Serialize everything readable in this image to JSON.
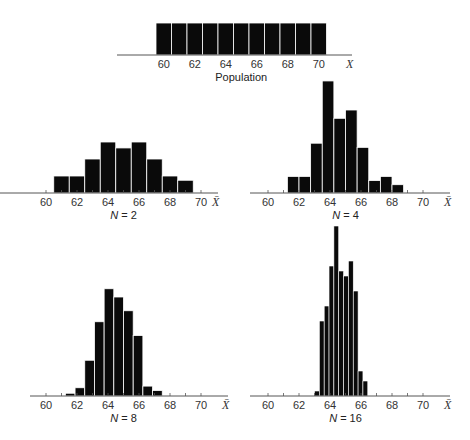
{
  "chart_data": [
    {
      "id": "population",
      "type": "bar",
      "title": "Population",
      "xlabel": "X",
      "x_ticks": [
        60,
        62,
        64,
        66,
        68,
        70
      ],
      "bin_width": 1,
      "bins": [
        60,
        61,
        62,
        63,
        64,
        65,
        66,
        67,
        68,
        69,
        70
      ],
      "values": [
        1,
        1,
        1,
        1,
        1,
        1,
        1,
        1,
        1,
        1,
        1
      ],
      "xlim": [
        59.5,
        71.5
      ],
      "layout": {
        "x0": 156,
        "x60": 156,
        "scale": 15.5,
        "baseline": 55,
        "height_per_unit": 32,
        "axis_left": 117,
        "axis_right": 352
      }
    },
    {
      "id": "n2",
      "type": "bar",
      "title": "N = 2",
      "xlabel": "X̄",
      "x_ticks": [
        60,
        62,
        64,
        66,
        68,
        70
      ],
      "bin_width": 1,
      "bins": [
        60.5,
        61.5,
        62.5,
        63.5,
        64.5,
        65.5,
        66.5,
        67.5,
        68.5
      ],
      "values": [
        2,
        2,
        4,
        6,
        5.3,
        6,
        4,
        2,
        1.5
      ],
      "xlim": [
        58,
        72
      ],
      "layout": {
        "x60": 46,
        "scale": 15.5,
        "baseline": 193,
        "height_per_unit": 8.5,
        "axis_left": 0,
        "axis_right": 218
      }
    },
    {
      "id": "n4",
      "type": "bar",
      "title": "N = 4",
      "xlabel": "X̄",
      "x_ticks": [
        60,
        62,
        64,
        66,
        68,
        70
      ],
      "bin_width": 0.75,
      "bins": [
        61.25,
        62,
        62.75,
        63.5,
        64.25,
        65,
        65.75,
        66.5,
        67.25,
        68
      ],
      "values": [
        2,
        2,
        6,
        13.5,
        9,
        10,
        5.5,
        1.5,
        2,
        1
      ],
      "xlim": [
        58,
        72
      ],
      "layout": {
        "x60": 268,
        "scale": 15.5,
        "baseline": 193,
        "height_per_unit": 8.3,
        "axis_left": 250,
        "axis_right": 450
      }
    },
    {
      "id": "n8",
      "type": "bar",
      "title": "N = 8",
      "xlabel": "X̄",
      "x_ticks": [
        60,
        62,
        64,
        66,
        68,
        70
      ],
      "bin_width": 0.625,
      "bins": [
        61.25,
        61.875,
        62.5,
        63.125,
        63.75,
        64.375,
        65,
        65.625,
        66.25,
        66.875
      ],
      "values": [
        0.5,
        1.5,
        6.5,
        13.5,
        19.5,
        18,
        15.5,
        11,
        1.8,
        1
      ],
      "xlim": [
        58,
        72
      ],
      "layout": {
        "x60": 46,
        "scale": 15.5,
        "baseline": 396,
        "height_per_unit": 5.5,
        "axis_left": 30,
        "axis_right": 228
      }
    },
    {
      "id": "n16",
      "type": "bar",
      "title": "N = 16",
      "xlabel": "X̄",
      "x_ticks": [
        60,
        62,
        64,
        66,
        68,
        70
      ],
      "bin_width": 0.3125,
      "bins": [
        63.0,
        63.3125,
        63.625,
        63.9375,
        64.25,
        64.5625,
        64.875,
        65.1875,
        65.5,
        65.8125,
        66.125
      ],
      "values": [
        1,
        15,
        18,
        26,
        34,
        25,
        24,
        27,
        21,
        5,
        3
      ],
      "xlim": [
        58,
        72
      ],
      "layout": {
        "x60": 268,
        "scale": 15.5,
        "baseline": 396,
        "height_per_unit": 5,
        "axis_left": 250,
        "axis_right": 450
      }
    }
  ],
  "colors": {
    "bar": "#0a0a0a",
    "bar_gap": "#ffffff",
    "axis": "#555555",
    "text": "#333333"
  }
}
